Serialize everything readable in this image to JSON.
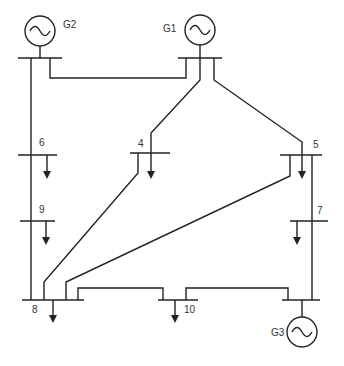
{
  "diagram": {
    "type": "power-system-one-line",
    "buses": [
      "1",
      "2",
      "3",
      "4",
      "5",
      "6",
      "7",
      "8",
      "9",
      "10"
    ],
    "labels": {
      "g1": "G1",
      "g2": "G2",
      "g3": "G3",
      "bus4": "4",
      "bus5": "5",
      "bus6": "6",
      "bus7": "7",
      "bus8": "8",
      "bus9": "9",
      "bus10": "10"
    },
    "generators": [
      {
        "name": "G1",
        "bus": "G1 bus"
      },
      {
        "name": "G2",
        "bus": "G2 bus"
      },
      {
        "name": "G3",
        "bus": "G3 bus"
      }
    ],
    "loads": [
      "4",
      "5",
      "6",
      "7",
      "8",
      "9",
      "10"
    ],
    "colors": {
      "line": "#222222",
      "text": "#333333",
      "background": "#ffffff"
    }
  }
}
